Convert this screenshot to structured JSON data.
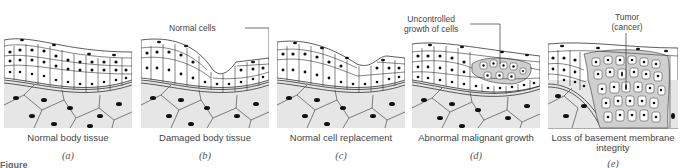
{
  "figure": {
    "label_fragment": "Figure",
    "panels": [
      {
        "id": "a",
        "letter": "(a)",
        "caption": "Normal body tissue"
      },
      {
        "id": "b",
        "letter": "(b)",
        "caption": "Damaged body tissue",
        "callout": "Normal cells"
      },
      {
        "id": "c",
        "letter": "(c)",
        "caption": "Normal cell replacement"
      },
      {
        "id": "d",
        "letter": "(d)",
        "caption": "Abnormal malignant growth",
        "callout_line1": "Uncontrolled",
        "callout_line2": "growth of cells"
      },
      {
        "id": "e",
        "letter": "(e)",
        "caption_line1": "Loss of basement membrane",
        "caption_line2": "integrity",
        "callout_line1": "Tumor",
        "callout_line2": "(cancer)"
      }
    ]
  },
  "colors": {
    "epithelium_fill": "#ffffff",
    "connective_tissue_fill": "#e6e6e6",
    "tumor_fill": "#cfcfcf",
    "outline": "#333333",
    "nucleus": "#111111"
  }
}
